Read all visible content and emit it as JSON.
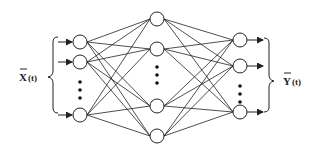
{
  "diagram": {
    "type": "feedforward-neural-network",
    "input_label": "X(t)",
    "output_label": "Y(t)",
    "input_label_main": "X",
    "input_label_arg": "(t)",
    "output_label_main": "Y",
    "output_label_arg": "(t)",
    "layers": {
      "input": {
        "x": 80,
        "nodes_y": [
          42,
          62,
          115
        ],
        "ellipsis": true
      },
      "hidden": {
        "x": 157,
        "nodes_y": [
          19,
          49,
          106,
          136
        ],
        "ellipsis": true
      },
      "output": {
        "x": 240,
        "nodes_y": [
          40,
          66,
          112
        ],
        "ellipsis": true
      }
    },
    "node_radius": 7,
    "stroke_color": "#222222"
  }
}
